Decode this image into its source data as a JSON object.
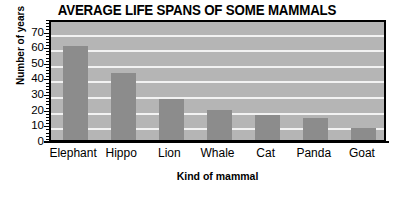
{
  "chart_data": {
    "type": "bar",
    "title": "AVERAGE LIFE SPANS OF SOME MAMMALS",
    "xlabel": "Kind of mammal",
    "ylabel": "Number of years",
    "categories": [
      "Elephant",
      "Hippo",
      "Lion",
      "Whale",
      "Cat",
      "Panda",
      "Goat"
    ],
    "values": [
      60,
      43,
      26,
      19,
      16,
      14,
      8
    ],
    "ylim": [
      0,
      78
    ],
    "yticks": [
      0,
      10,
      20,
      30,
      40,
      50,
      60,
      70
    ],
    "ytick_labels": [
      "0",
      "10",
      "20",
      "30",
      "40",
      "50",
      "60",
      "70"
    ],
    "ytick_minor_step": 2,
    "grid": true,
    "grid_axis": "y",
    "grid_color": "#f2f2f2",
    "legend": false,
    "bar_color": "#8c8c8c",
    "plot_background": "#b5b5b5",
    "figure_background": "#ffffff",
    "axis_color": "#000000",
    "text_color": "#000000"
  }
}
